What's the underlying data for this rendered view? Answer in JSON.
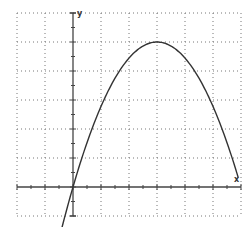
{
  "chart_data": {
    "type": "line",
    "title": "",
    "xlabel": "x",
    "ylabel": "y",
    "grid": true,
    "grid_style": "dotted",
    "xlim": [
      -2,
      6
    ],
    "ylim": [
      -1,
      6
    ],
    "x_ticks": [
      -2,
      -1,
      0,
      1,
      2,
      3,
      4,
      5,
      6
    ],
    "y_ticks": [
      -1,
      0,
      1,
      2,
      3,
      4,
      5,
      6
    ],
    "series": [
      {
        "name": "parabola",
        "equation": "y = -5/9 (x - 3)^2 + 5",
        "x": [
          -0.5,
          0,
          0.5,
          1,
          1.5,
          2,
          2.5,
          3,
          3.5,
          4,
          4.5,
          5,
          5.5,
          5.9
        ],
        "y": [
          -1.81,
          0,
          1.53,
          2.78,
          3.75,
          4.44,
          4.86,
          5,
          4.86,
          4.44,
          3.75,
          2.78,
          1.53,
          0.33
        ],
        "vertex": [
          3,
          5
        ],
        "roots": [
          0,
          6
        ],
        "color": "#333333"
      }
    ]
  },
  "labels": {
    "x_axis": "x",
    "y_axis": "y"
  }
}
